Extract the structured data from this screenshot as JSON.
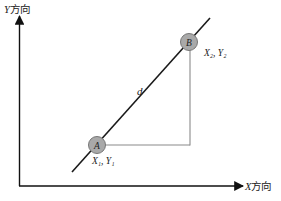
{
  "diagram": {
    "y_axis": {
      "label_var": "Y",
      "label_suffix": "方向"
    },
    "x_axis": {
      "label_var": "X",
      "label_suffix": "方向"
    },
    "line_label": "d",
    "points": [
      {
        "name": "A",
        "coord_label": "X₁, Y₁"
      },
      {
        "name": "B",
        "coord_label": "X₂, Y₂"
      }
    ],
    "colors": {
      "axis": "#111111",
      "line": "#1a1a1a",
      "point_fill": "#a9a9a9",
      "point_stroke": "#777777",
      "guide": "#8a8a8a"
    }
  }
}
